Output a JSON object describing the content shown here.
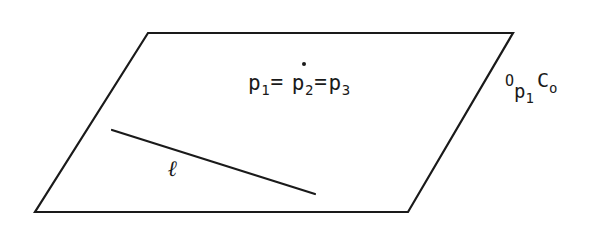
{
  "figure": {
    "background_color": "#ffffff",
    "stroke_color": "#1a1a1a",
    "width": 603,
    "height": 225,
    "shape": {
      "name": "parallelogram",
      "vertices": [
        {
          "x": 148,
          "y": 33
        },
        {
          "x": 513,
          "y": 33
        },
        {
          "x": 408,
          "y": 212
        },
        {
          "x": 35,
          "y": 212
        }
      ],
      "stroke_width": 2.2
    },
    "segment": {
      "name": "line-ell",
      "x1": 112,
      "y1": 130,
      "x2": 315,
      "y2": 194,
      "stroke_width": 2.2
    }
  },
  "labels": {
    "equation": {
      "p": "p",
      "sub1": "1",
      "sub2": "2",
      "sub3": "3",
      "equals": "=",
      "full_text": "p1= p2= p3",
      "has_overdot_on_p2": true
    },
    "ell": {
      "text": "ℓ"
    },
    "corner": {
      "o_upper": "O",
      "p": "p",
      "p_sub": "1",
      "c": "C",
      "c_sub": "o",
      "full_text": "Op1Co"
    }
  }
}
